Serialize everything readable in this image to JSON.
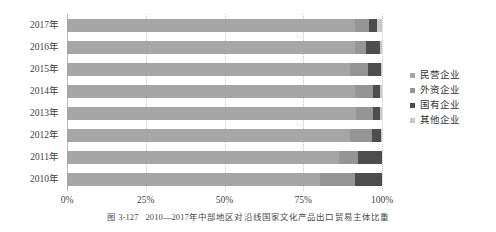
{
  "caption": {
    "figure_number": "图 3-127",
    "text": "2010—2017年中部地区对沿线国家文化产品出口贸易主体比重"
  },
  "legend": {
    "position": "right",
    "items": [
      {
        "label": "民营企业",
        "color": "#a6a6a6"
      },
      {
        "label": "外资企业",
        "color": "#959595"
      },
      {
        "label": "国有企业",
        "color": "#4d4d4d"
      },
      {
        "label": "其他企业",
        "color": "#c9c9c9"
      }
    ]
  },
  "axis": {
    "x_ticks": [
      "0%",
      "25%",
      "50%",
      "75%",
      "100%"
    ],
    "x_tick_values": [
      0,
      25,
      50,
      75,
      100
    ],
    "y_ticks": [
      "2017年",
      "2016年",
      "2015年",
      "2014年",
      "2013年",
      "2012年",
      "2011年",
      "2010年"
    ]
  },
  "chart_data": {
    "type": "bar",
    "orientation": "horizontal",
    "stacked": true,
    "normalized": true,
    "title": "2010—2017年中部地区对沿线国家文化产品出口贸易主体比重",
    "xlabel": "",
    "ylabel": "",
    "xlim": [
      0,
      100
    ],
    "xtick_labels": [
      "0%",
      "25%",
      "50%",
      "75%",
      "100%"
    ],
    "grid": true,
    "legend_position": "right",
    "categories": [
      "2017年",
      "2016年",
      "2015年",
      "2014年",
      "2013年",
      "2012年",
      "2011年",
      "2010年"
    ],
    "series": [
      {
        "name": "民营企业",
        "color": "#a6a6a6",
        "values": [
          91.4,
          91.4,
          89.8,
          91.4,
          91.7,
          89.8,
          86.4,
          80.3
        ]
      },
      {
        "name": "外资企业",
        "color": "#959595",
        "values": [
          4.6,
          3.6,
          5.8,
          5.6,
          5.3,
          7.0,
          6.0,
          11.1
        ]
      },
      {
        "name": "国有企业",
        "color": "#4d4d4d",
        "values": [
          2.3,
          4.4,
          4.1,
          2.5,
          2.5,
          2.9,
          7.6,
          8.6
        ]
      },
      {
        "name": "其他企业",
        "color": "#c9c9c9",
        "values": [
          1.7,
          0.6,
          0.3,
          0.5,
          0.5,
          0.3,
          0.0,
          0.0
        ]
      }
    ]
  }
}
